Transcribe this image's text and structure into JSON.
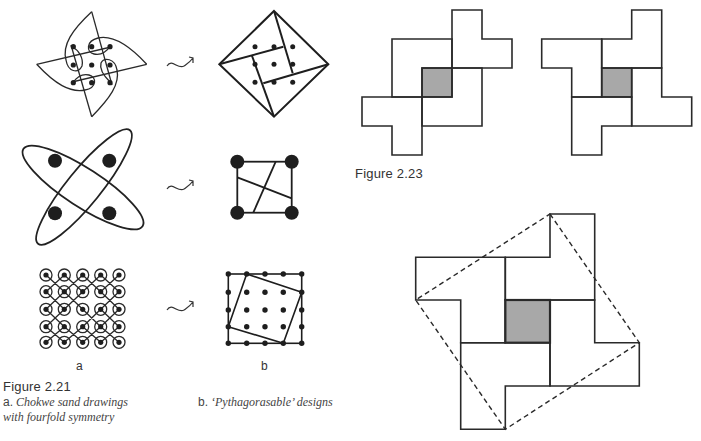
{
  "figure_2_21": {
    "title": "Figure 2.21",
    "column_a_label": "a",
    "column_b_label": "b",
    "caption_a_prefix": "a.",
    "caption_a_line1": "Chokwe sand drawings",
    "caption_a_line2": "with fourfold symmetry",
    "caption_b_prefix": "b.",
    "caption_b_text": "‘Pythagorasable’ designs",
    "rows": [
      {
        "a": "pinwheel-sand-drawing-3x3-dots",
        "arrow": "transform-arrow",
        "b": "diamond-with-inner-square-3x3-dots"
      },
      {
        "a": "two-crossed-ellipses-4-dots",
        "arrow": "transform-arrow",
        "b": "square-with-4-corner-dots"
      },
      {
        "a": "looped-lattice-5x5-dots",
        "arrow": "transform-arrow",
        "b": "5x5-grid-with-tilted-square"
      }
    ]
  },
  "figure_2_23": {
    "title": "Figure 2.23",
    "panels": [
      "left-pinwheel-dissection",
      "right-pinwheel-dissection",
      "large-pinwheel-with-dashed-square"
    ],
    "center_fill_color": "#a8a8a8",
    "line_color": "#2a2a2a"
  }
}
